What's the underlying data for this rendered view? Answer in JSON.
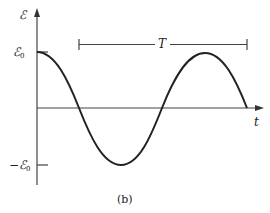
{
  "figure": {
    "caption": "(b)",
    "y_axis_label": "ℰ",
    "x_axis_label": "t",
    "y_ticks": [
      {
        "symbol": "ℰ",
        "subscript": "0",
        "prefix": ""
      },
      {
        "symbol": "ℰ",
        "subscript": "0",
        "prefix": "−"
      }
    ],
    "period_label": "T",
    "curve": "cosine"
  },
  "colors": {
    "line": "#222222",
    "axis": "#444444",
    "background": "#ffffff"
  }
}
